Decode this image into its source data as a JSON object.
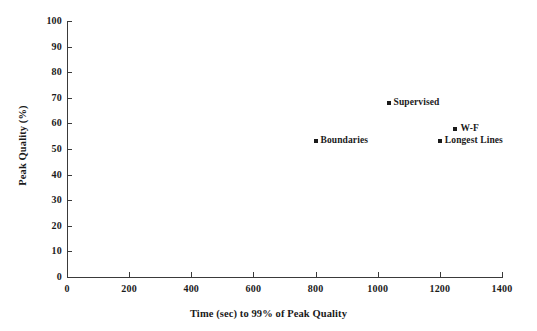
{
  "chart_data": {
    "type": "scatter",
    "title": "",
    "xlabel": "Time (sec) to 99% of Peak Quality",
    "ylabel": "Peak Quality (%)",
    "xlim": [
      0,
      1400
    ],
    "ylim": [
      0,
      100
    ],
    "xticks": [
      0,
      200,
      400,
      600,
      800,
      1000,
      1200,
      1400
    ],
    "yticks": [
      0,
      10,
      20,
      30,
      40,
      50,
      60,
      70,
      80,
      90,
      100
    ],
    "xtick_labels": [
      "0",
      "200",
      "400",
      "600",
      "800",
      "1000",
      "1200",
      "1400"
    ],
    "ytick_labels": [
      "0",
      "10",
      "20",
      "30",
      "40",
      "50",
      "60",
      "70",
      "80",
      "90",
      "100"
    ],
    "grid": false,
    "legend": "none",
    "marker": "square",
    "marker_color": "#1a1a1a",
    "points": [
      {
        "label": "Supervised",
        "x": 1035,
        "y": 68,
        "label_side": "right"
      },
      {
        "label": "W-F",
        "x": 1250,
        "y": 58,
        "label_side": "right"
      },
      {
        "label": "Boundaries",
        "x": 800,
        "y": 53,
        "label_side": "right"
      },
      {
        "label": "Longest Lines",
        "x": 1200,
        "y": 53,
        "label_side": "right"
      }
    ]
  },
  "colors": {
    "axis": "#3a3a3a",
    "text": "#1a1a1a",
    "marker": "#1a1a1a",
    "background": "#ffffff"
  }
}
